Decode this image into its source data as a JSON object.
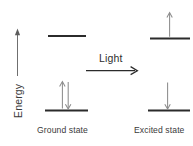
{
  "figure": {
    "type": "energy-level-diagram",
    "background_color": "#ffffff",
    "title": "",
    "axis": {
      "label": "Energy",
      "direction": "up",
      "arrow_color": "#6f6f6f"
    },
    "process": {
      "label": "Light",
      "direction": "right",
      "arrow_color": "#2b2b2b"
    },
    "colors": {
      "level_line": "#2b2b2b",
      "electron_arrow": "#8c8c8c",
      "text": "#3a3a3a"
    },
    "states": [
      {
        "id": "ground",
        "caption": "Ground state",
        "levels": [
          {
            "name": "upper-level",
            "position": "upper",
            "electrons": []
          },
          {
            "name": "lower-level",
            "position": "lower",
            "electrons": [
              "up",
              "down"
            ]
          }
        ]
      },
      {
        "id": "excited",
        "caption": "Excited state",
        "levels": [
          {
            "name": "upper-level",
            "position": "upper",
            "electrons": [
              "up"
            ]
          },
          {
            "name": "lower-level",
            "position": "lower",
            "electrons": [
              "down"
            ]
          }
        ]
      }
    ]
  }
}
